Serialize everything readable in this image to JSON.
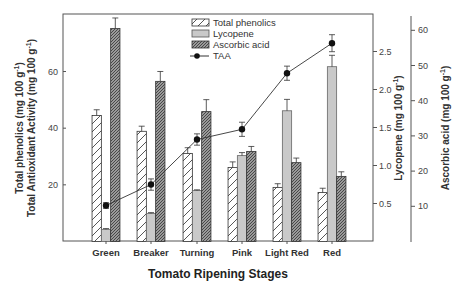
{
  "chart_data": {
    "type": "bar",
    "title": "",
    "xlabel": "Tomato Ripening Stages",
    "ylabel_left": [
      "Total phenolics (mg 100 g-1)",
      "Total Antioxidant Activity (mg 100 g-1)"
    ],
    "ylabel_right_1": "Lycopene (mg 100 g-1)",
    "ylabel_right_2": "Ascorbic acid (mg 100 g-1)",
    "categories": [
      "Green",
      "Breaker",
      "Turning",
      "Pink",
      "Light Red",
      "Red"
    ],
    "axes": {
      "left": {
        "ylim": [
          0,
          80
        ],
        "ticks": [
          20,
          40,
          60
        ]
      },
      "lycopene": {
        "ylim": [
          0,
          3.1
        ],
        "ticks": [
          0.5,
          1.0,
          1.5,
          2.0,
          2.5
        ]
      },
      "ascorbic": {
        "ylim": [
          0,
          64
        ],
        "ticks": [
          10,
          20,
          30,
          40,
          50,
          60
        ]
      }
    },
    "series": [
      {
        "name": "Total phenolics",
        "type": "bar",
        "axis": "left",
        "values": [
          44.5,
          38.9,
          31.1,
          26.1,
          19.1,
          17.3
        ],
        "errors": [
          2.0,
          1.8,
          2.0,
          2.0,
          1.3,
          1.5
        ]
      },
      {
        "name": "Lycopene",
        "type": "bar",
        "axis": "lycopene",
        "values": [
          0.16,
          0.37,
          0.67,
          1.13,
          1.72,
          2.3
        ],
        "errors": [
          0.01,
          0.01,
          0.01,
          0.04,
          0.15,
          0.15
        ]
      },
      {
        "name": "Ascorbic acid",
        "type": "bar",
        "axis": "ascorbic",
        "values": [
          60.5,
          45.5,
          36.9,
          25.6,
          22.4,
          18.5
        ],
        "errors": [
          3.0,
          2.8,
          3.4,
          1.4,
          1.3,
          1.3
        ]
      },
      {
        "name": "TAA",
        "type": "line",
        "axis": "left",
        "values": [
          12.7,
          20.1,
          36.0,
          39.6,
          59.4,
          70.0
        ],
        "errors": [
          1.0,
          2.0,
          2.0,
          2.5,
          2.5,
          3.0
        ]
      }
    ],
    "legend_position": "upper center inside plot",
    "grid": false
  },
  "legend": {
    "items": [
      "Total phenolics",
      "Lycopene",
      "Ascorbic acid",
      "TAA"
    ]
  },
  "labels": {
    "x_title": "Tomato Ripening Stages",
    "y_left_line1": "Total phenolics (mg 100 g",
    "y_left_line2": "Total Antioxidant Activity (mg 100 g",
    "y_right1": "Lycopene (mg 100 g",
    "y_right2": "Ascorbic acid (mg 100 g",
    "superscript": "-1",
    "close_paren": ")"
  },
  "colors": {
    "frame": "#555555",
    "phenolics_fill": "#ffffff",
    "lycopene_fill": "#c9c9c9",
    "ascorbic_fill": "#8a8a8a",
    "line": "#333333",
    "marker": "#111111"
  }
}
